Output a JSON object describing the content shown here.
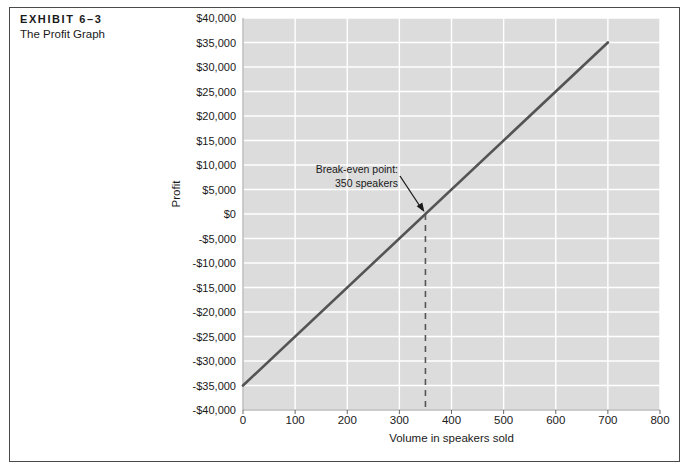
{
  "exhibit": {
    "number_label": "EXHIBIT 6–3",
    "subtitle": "The Profit Graph"
  },
  "chart_data": {
    "type": "line",
    "title": "The Profit Graph",
    "xlabel": "Volume in speakers sold",
    "ylabel": "Profit",
    "xlim": [
      0,
      800
    ],
    "ylim": [
      -40000,
      40000
    ],
    "grid": true,
    "legend": "none",
    "x_ticks": [
      "0",
      "100",
      "200",
      "300",
      "400",
      "500",
      "600",
      "700",
      "800"
    ],
    "x_tick_values": [
      0,
      100,
      200,
      300,
      400,
      500,
      600,
      700,
      800
    ],
    "y_ticks": [
      "$40,000",
      "$35,000",
      "$30,000",
      "$25,000",
      "$20,000",
      "$15,000",
      "$10,000",
      "$5,000",
      "$0",
      "-$5,000",
      "-$10,000",
      "-$15,000",
      "-$20,000",
      "-$25,000",
      "-$30,000",
      "-$35,000",
      "-$40,000"
    ],
    "y_tick_values": [
      40000,
      35000,
      30000,
      25000,
      20000,
      15000,
      10000,
      5000,
      0,
      -5000,
      -10000,
      -15000,
      -20000,
      -25000,
      -30000,
      -35000,
      -40000
    ],
    "series": [
      {
        "name": "Profit",
        "x": [
          0,
          700
        ],
        "values": [
          -35000,
          35000
        ],
        "points": [
          {
            "x": 0,
            "y": -35000
          },
          {
            "x": 100,
            "y": -25000
          },
          {
            "x": 200,
            "y": -15000
          },
          {
            "x": 300,
            "y": -5000
          },
          {
            "x": 350,
            "y": 0
          },
          {
            "x": 400,
            "y": 5000
          },
          {
            "x": 500,
            "y": 15000
          },
          {
            "x": 600,
            "y": 25000
          },
          {
            "x": 700,
            "y": 35000
          }
        ]
      }
    ],
    "annotations": [
      {
        "name": "break-even",
        "line1": "Break-even point:",
        "line2": "350 speakers",
        "target_x": 350,
        "target_y": 0
      }
    ],
    "colors": {
      "plot_background": "#dcdcdc",
      "gridline": "#ffffff",
      "line": "#545454",
      "axis_text": "#1a1a1a",
      "frame": "#4a4a4a"
    }
  }
}
